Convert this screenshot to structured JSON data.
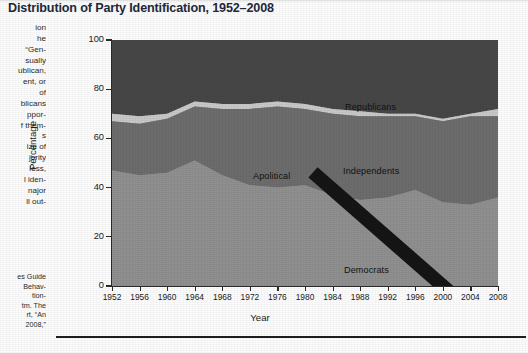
{
  "figure": {
    "title": "Distribution of Party Identification, 1952–2008",
    "bottom_rule": "horizontal-rule"
  },
  "side_column": {
    "body_lines": [
      "ion",
      "he",
      "“Gen-",
      "sually",
      "ublican,",
      "ent, or",
      "of",
      "blicans",
      "ppor-",
      "f them-",
      "s",
      "ize of",
      "jority",
      "less,",
      "l iden-",
      "najor",
      "ll out-"
    ],
    "note_lines": [
      "es Guide",
      "Behav-",
      "tion-",
      "tm. The",
      "rt, “An",
      "2008,”"
    ]
  },
  "chart_data": {
    "type": "area",
    "stacked": true,
    "title": "Distribution of Party Identification, 1952–2008",
    "xlabel": "Year",
    "ylabel": "Percentage",
    "xlim": [
      1952,
      2008
    ],
    "ylim": [
      0,
      100
    ],
    "grid": false,
    "legend_position": "in-plot-labels",
    "x": [
      1952,
      1956,
      1960,
      1964,
      1968,
      1972,
      1976,
      1980,
      1984,
      1988,
      1992,
      1996,
      2000,
      2004,
      2008
    ],
    "xticklabels": [
      "1952",
      "1956",
      "1960",
      "1964",
      "1968",
      "1972",
      "1976",
      "1980",
      "1984",
      "1988",
      "1992",
      "1996",
      "2000",
      "2004",
      "2008"
    ],
    "yticks": [
      0,
      20,
      40,
      60,
      80,
      100
    ],
    "yticklabels": [
      "0",
      "20",
      "40",
      "60",
      "80",
      "100"
    ],
    "series": [
      {
        "name": "Democrats",
        "color": "#909090",
        "order": 1,
        "values": [
          47,
          45,
          46,
          51,
          45,
          41,
          40,
          41,
          37,
          35,
          36,
          39,
          34,
          33,
          36
        ]
      },
      {
        "name": "Independents",
        "color": "#6d6d6d",
        "order": 2,
        "values": [
          20,
          21,
          22,
          22,
          27,
          31,
          33,
          31,
          33,
          34,
          33,
          30,
          33,
          36,
          33
        ]
      },
      {
        "name": "Apolitical",
        "color": "#c9c9c9",
        "order": 3,
        "values": [
          3,
          3,
          2,
          2,
          2,
          2,
          2,
          2,
          2,
          2,
          1,
          1,
          1,
          1,
          3
        ]
      },
      {
        "name": "Republicans",
        "color": "#474747",
        "order": 4,
        "values": [
          30,
          31,
          30,
          25,
          26,
          26,
          25,
          26,
          28,
          29,
          30,
          30,
          32,
          30,
          28
        ]
      }
    ],
    "cumulative_tops": {
      "democrats": [
        47,
        45,
        46,
        51,
        45,
        41,
        40,
        41,
        37,
        35,
        36,
        39,
        34,
        33,
        36
      ],
      "independents": [
        67,
        66,
        68,
        73,
        72,
        72,
        73,
        72,
        70,
        69,
        69,
        69,
        67,
        69,
        69
      ],
      "apolitical": [
        70,
        69,
        70,
        75,
        74,
        74,
        75,
        74,
        72,
        71,
        70,
        70,
        68,
        70,
        72
      ],
      "republicans": [
        100,
        100,
        100,
        100,
        100,
        100,
        100,
        100,
        100,
        100,
        100,
        100,
        100,
        100,
        100
      ]
    },
    "annotations": [
      {
        "name": "Republicans",
        "text": "Republicans"
      },
      {
        "name": "Independents",
        "text": "Independents"
      },
      {
        "name": "Democrats",
        "text": "Democrats"
      },
      {
        "name": "Apolitical",
        "text": "Apolitical",
        "has_leader_line": true
      }
    ]
  },
  "colors": {
    "republicans": "#474747",
    "independents": "#6d6d6d",
    "apolitical": "#c9c9c9",
    "democrats": "#909090",
    "axis": "#2a2a2a",
    "title": "#1d2a3a"
  }
}
